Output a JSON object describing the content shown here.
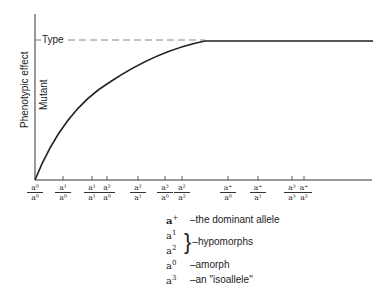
{
  "diagram": {
    "y_axis_label": "Phenotypic effect",
    "mutant_label": "Mutant",
    "type_label": "Type",
    "curve": "saturating increase from origin to Type level plateau",
    "x_ticks": [
      {
        "num": "a⁰",
        "den": "a⁰",
        "x": 35
      },
      {
        "num": "a¹",
        "den": "a⁰",
        "x": 63
      },
      {
        "num": "a¹",
        "den": "a¹",
        "x": 92
      },
      {
        "num": "a²",
        "den": "a⁰",
        "x": 107
      },
      {
        "num": "a²",
        "den": "a¹",
        "x": 138
      },
      {
        "num": "a³",
        "den": "a⁰",
        "x": 165
      },
      {
        "num": "a²",
        "den": "a²",
        "x": 182
      },
      {
        "num": "a⁺",
        "den": "a⁰",
        "x": 228
      },
      {
        "num": "a⁺",
        "den": "a¹",
        "x": 258
      },
      {
        "num": "a³",
        "den": "a³",
        "x": 292
      },
      {
        "num": "a⁺",
        "den": "a²",
        "x": 304
      }
    ]
  },
  "legend": {
    "dominant": {
      "sym": "a",
      "sup": "+",
      "text": "–the dominant allele"
    },
    "hypo1": {
      "sym": "a",
      "sup": "1"
    },
    "hypo2": {
      "sym": "a",
      "sup": "2"
    },
    "hypo_text": "–hypomorphs",
    "amorph": {
      "sym": "a",
      "sup": "0",
      "text": "–amorph"
    },
    "isoallele": {
      "sym": "a",
      "sup": "3",
      "text": "–an \"isoallele\""
    }
  }
}
